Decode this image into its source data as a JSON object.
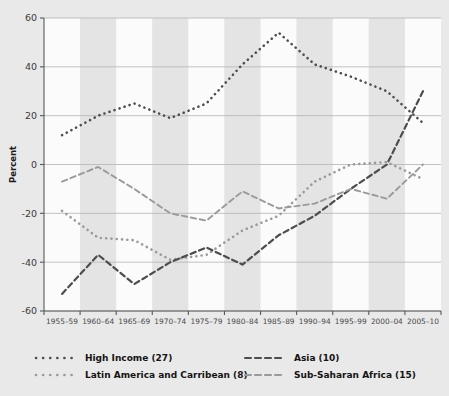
{
  "chart_data": {
    "type": "line",
    "title": "",
    "xlabel": "",
    "ylabel": "Percent",
    "ylim": [
      -60,
      60
    ],
    "yticks": [
      -60,
      -40,
      -20,
      0,
      20,
      40,
      60
    ],
    "grid": true,
    "legend_position": "bottom",
    "categories": [
      "1955–59",
      "1960–64",
      "1965–69",
      "1970–74",
      "1975–79",
      "1980–84",
      "1985–89",
      "1990–94",
      "1995–99",
      "2000–04",
      "2005–10"
    ],
    "series": [
      {
        "name": "High Income (27)",
        "style": "dotted",
        "color": "#4d4d4d",
        "values": [
          12,
          20,
          25,
          19,
          25,
          41,
          54,
          41,
          36,
          30,
          17
        ]
      },
      {
        "name": "Latin America and Carribean (8)",
        "style": "dotted",
        "color": "#9a9a9a",
        "values": [
          -19,
          -30,
          -31,
          -39,
          -37,
          -27,
          -21,
          -7,
          0,
          1,
          -6
        ]
      },
      {
        "name": "Asia (10)",
        "style": "dashed",
        "color": "#4d4d4d",
        "values": [
          -53,
          -37,
          -49,
          -40,
          -34,
          -41,
          -29,
          -21,
          -10,
          0,
          30
        ]
      },
      {
        "name": "Sub-Saharan Africa (15)",
        "style": "dashed",
        "color": "#9a9a9a",
        "values": [
          -7,
          -1,
          -10,
          -20,
          -23,
          -11,
          -18,
          -16,
          -10,
          -14,
          0
        ]
      }
    ]
  },
  "legend": {
    "entries": [
      {
        "label": "High Income (27)",
        "marker": "dotted-marker"
      },
      {
        "label": "Asia (10)",
        "marker": "dashed-marker"
      },
      {
        "label": "Latin America and Carribean (8)",
        "marker": "dotted-marker"
      },
      {
        "label": "Sub-Saharan Africa (15)",
        "marker": "dashed-marker"
      }
    ]
  },
  "colors": {
    "background": "#e9e9e9",
    "plot_light_band": "#fbfbfb",
    "plot_dark_band": "#e4e4e4",
    "gridline": "#b4b4b4",
    "axis": "#585858",
    "dark_series": "#4d4d4d",
    "light_series": "#9a9a9a"
  }
}
